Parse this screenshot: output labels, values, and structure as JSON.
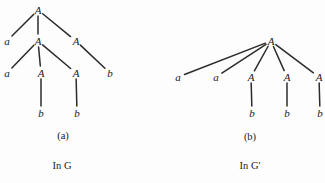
{
  "figure": {
    "background_color": "#fdfdfd",
    "ink_color": "#2b2b2b",
    "panels": [
      {
        "id": "panel-a",
        "caption": "(a)",
        "subcaption": "In G",
        "caption_pos": {
          "x": 63,
          "y": 136
        },
        "subcaption_pos": {
          "x": 62,
          "y": 166
        },
        "nodes": [
          {
            "id": "a-n0",
            "label": "A",
            "x": 38,
            "y": 10
          },
          {
            "id": "a-n1",
            "label": "a",
            "x": 7,
            "y": 41
          },
          {
            "id": "a-n2",
            "label": "A",
            "x": 38,
            "y": 41
          },
          {
            "id": "a-n3",
            "label": "A",
            "x": 76,
            "y": 41
          },
          {
            "id": "a-n4",
            "label": "a",
            "x": 7,
            "y": 73
          },
          {
            "id": "a-n5",
            "label": "A",
            "x": 41,
            "y": 73
          },
          {
            "id": "a-n6",
            "label": "A",
            "x": 76,
            "y": 73
          },
          {
            "id": "a-n7",
            "label": "b",
            "x": 110,
            "y": 73
          },
          {
            "id": "a-n8",
            "label": "b",
            "x": 41,
            "y": 113
          },
          {
            "id": "a-n9",
            "label": "b",
            "x": 77,
            "y": 113
          }
        ],
        "edges": [
          {
            "from": "a-n0",
            "to": "a-n1"
          },
          {
            "from": "a-n0",
            "to": "a-n2"
          },
          {
            "from": "a-n0",
            "to": "a-n3"
          },
          {
            "from": "a-n2",
            "to": "a-n4"
          },
          {
            "from": "a-n2",
            "to": "a-n5"
          },
          {
            "from": "a-n2",
            "to": "a-n6"
          },
          {
            "from": "a-n3",
            "to": "a-n7"
          },
          {
            "from": "a-n5",
            "to": "a-n8"
          },
          {
            "from": "a-n6",
            "to": "a-n9"
          }
        ]
      },
      {
        "id": "panel-b",
        "caption": "(b)",
        "subcaption": "In G'",
        "caption_pos": {
          "x": 250,
          "y": 137
        },
        "subcaption_pos": {
          "x": 250,
          "y": 166
        },
        "nodes": [
          {
            "id": "b-n0",
            "label": "A",
            "x": 271,
            "y": 41
          },
          {
            "id": "b-n1",
            "label": "a",
            "x": 178,
            "y": 77
          },
          {
            "id": "b-n2",
            "label": "a",
            "x": 216,
            "y": 77
          },
          {
            "id": "b-n3",
            "label": "A",
            "x": 251,
            "y": 77
          },
          {
            "id": "b-n4",
            "label": "A",
            "x": 287,
            "y": 77
          },
          {
            "id": "b-n5",
            "label": "A",
            "x": 319,
            "y": 77
          },
          {
            "id": "b-n6",
            "label": "b",
            "x": 252,
            "y": 113
          },
          {
            "id": "b-n7",
            "label": "b",
            "x": 287,
            "y": 113
          },
          {
            "id": "b-n8",
            "label": "b",
            "x": 320,
            "y": 113
          }
        ],
        "edges": [
          {
            "from": "b-n0",
            "to": "b-n1"
          },
          {
            "from": "b-n0",
            "to": "b-n2"
          },
          {
            "from": "b-n0",
            "to": "b-n3"
          },
          {
            "from": "b-n0",
            "to": "b-n4"
          },
          {
            "from": "b-n0",
            "to": "b-n5"
          },
          {
            "from": "b-n3",
            "to": "b-n6"
          },
          {
            "from": "b-n4",
            "to": "b-n7"
          },
          {
            "from": "b-n5",
            "to": "b-n8"
          }
        ]
      }
    ]
  }
}
